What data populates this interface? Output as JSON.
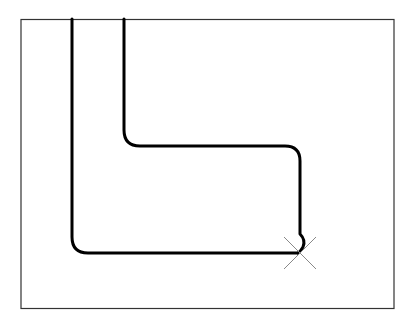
{
  "diagram": {
    "colors": {
      "background": "#ffffff",
      "frame": "#333333",
      "path": "#000000",
      "marker": "#888888"
    },
    "frame": {
      "x": 21,
      "y": 19,
      "width": 373,
      "height": 289
    },
    "marker": {
      "type": "x-cross",
      "cx": 300,
      "cy": 253
    }
  }
}
